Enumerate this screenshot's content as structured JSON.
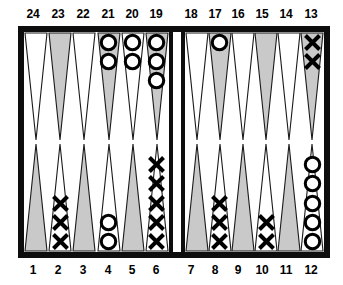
{
  "figure": {
    "board": {
      "frame_color": "#0d0d0d",
      "field_color": "#ffffff",
      "point_shaded_color": "#c9c9c9",
      "point_outline_color": "#1a1a1a",
      "checker_o_color": "#000000",
      "checker_x_color": "#000000"
    }
  },
  "labels": {
    "top": [
      {
        "id": "24",
        "text": "24"
      },
      {
        "id": "23",
        "text": "23"
      },
      {
        "id": "22",
        "text": "22"
      },
      {
        "id": "21",
        "text": "21"
      },
      {
        "id": "20",
        "text": "20"
      },
      {
        "id": "19",
        "text": "19"
      },
      {
        "id": "18",
        "text": "18"
      },
      {
        "id": "17",
        "text": "17"
      },
      {
        "id": "16",
        "text": "16"
      },
      {
        "id": "15",
        "text": "15"
      },
      {
        "id": "14",
        "text": "14"
      },
      {
        "id": "13",
        "text": "13"
      }
    ],
    "bottom": [
      {
        "id": "1",
        "text": "1"
      },
      {
        "id": "2",
        "text": "2"
      },
      {
        "id": "3",
        "text": "3"
      },
      {
        "id": "4",
        "text": "4"
      },
      {
        "id": "5",
        "text": "5"
      },
      {
        "id": "6",
        "text": "6"
      },
      {
        "id": "7",
        "text": "7"
      },
      {
        "id": "8",
        "text": "8"
      },
      {
        "id": "9",
        "text": "9"
      },
      {
        "id": "10",
        "text": "10"
      },
      {
        "id": "11",
        "text": "11"
      },
      {
        "id": "12",
        "text": "12"
      }
    ]
  },
  "points": {
    "top_left": [
      {
        "number": "24",
        "shaded": false,
        "checker": "",
        "count": 0
      },
      {
        "number": "23",
        "shaded": true,
        "checker": "",
        "count": 0
      },
      {
        "number": "22",
        "shaded": false,
        "checker": "",
        "count": 0
      },
      {
        "number": "21",
        "shaded": true,
        "checker": "O",
        "count": 2
      },
      {
        "number": "20",
        "shaded": false,
        "checker": "O",
        "count": 2
      },
      {
        "number": "19",
        "shaded": true,
        "checker": "O",
        "count": 3
      }
    ],
    "top_right": [
      {
        "number": "18",
        "shaded": false,
        "checker": "",
        "count": 0
      },
      {
        "number": "17",
        "shaded": true,
        "checker": "O",
        "count": 1
      },
      {
        "number": "16",
        "shaded": false,
        "checker": "",
        "count": 0
      },
      {
        "number": "15",
        "shaded": true,
        "checker": "",
        "count": 0
      },
      {
        "number": "14",
        "shaded": false,
        "checker": "",
        "count": 0
      },
      {
        "number": "13",
        "shaded": true,
        "checker": "X",
        "count": 2
      }
    ],
    "bottom_left": [
      {
        "number": "1",
        "shaded": true,
        "checker": "",
        "count": 0
      },
      {
        "number": "2",
        "shaded": false,
        "checker": "X",
        "count": 3
      },
      {
        "number": "3",
        "shaded": true,
        "checker": "",
        "count": 0
      },
      {
        "number": "4",
        "shaded": false,
        "checker": "O",
        "count": 2
      },
      {
        "number": "5",
        "shaded": true,
        "checker": "",
        "count": 0
      },
      {
        "number": "6",
        "shaded": false,
        "checker": "X",
        "count": 5
      }
    ],
    "bottom_right": [
      {
        "number": "7",
        "shaded": true,
        "checker": "",
        "count": 0
      },
      {
        "number": "8",
        "shaded": false,
        "checker": "X",
        "count": 3
      },
      {
        "number": "9",
        "shaded": true,
        "checker": "",
        "count": 0
      },
      {
        "number": "10",
        "shaded": false,
        "checker": "X",
        "count": 2
      },
      {
        "number": "11",
        "shaded": true,
        "checker": "",
        "count": 0
      },
      {
        "number": "12",
        "shaded": false,
        "checker": "O",
        "count": 5
      }
    ]
  },
  "bar": {
    "o_on_bar": 0,
    "x_on_bar": 0
  }
}
